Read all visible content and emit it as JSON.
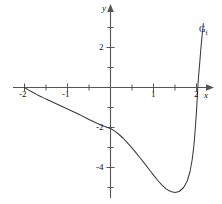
{
  "figure": {
    "background_color": "#ffffff",
    "line_color": "#3b3b3b",
    "text_color": "#111111"
  },
  "axes": {
    "x_axis_name": "x",
    "y_axis_name": "y"
  },
  "labels": {
    "curve_name_base": "G",
    "curve_name_sub": "f"
  },
  "chart_data": {
    "type": "line",
    "title": "",
    "xlabel": "x",
    "ylabel": "y",
    "grid": false,
    "legend": "none",
    "xlim": [
      -2.55,
      2.45
    ],
    "ylim": [
      -5.9,
      3.4
    ],
    "xticks_major": [
      -2,
      -1,
      1,
      2
    ],
    "xticks_major_labels": [
      "-2",
      "-1",
      "1",
      "2"
    ],
    "xticks_minor": [
      -1.5,
      -0.5,
      0.5,
      1.5
    ],
    "yticks_major": [
      2,
      -2,
      -4
    ],
    "yticks_major_labels": [
      "2",
      "-2",
      "-4"
    ],
    "yticks_minor": [
      3,
      1,
      -1,
      -3,
      -5
    ],
    "annotations": [
      {
        "text": "G_f",
        "x": 2.15,
        "y": 2.55
      }
    ],
    "series": [
      {
        "name": "G_f",
        "points": [
          [
            -2.0,
            0.0
          ],
          [
            -1.9,
            -0.13
          ],
          [
            -1.8,
            -0.25
          ],
          [
            -1.7,
            -0.37
          ],
          [
            -1.6,
            -0.47
          ],
          [
            -1.5,
            -0.58
          ],
          [
            -1.4,
            -0.68
          ],
          [
            -1.3,
            -0.78
          ],
          [
            -1.2,
            -0.88
          ],
          [
            -1.1,
            -0.98
          ],
          [
            -1.0,
            -1.08
          ],
          [
            -0.9,
            -1.18
          ],
          [
            -0.8,
            -1.28
          ],
          [
            -0.7,
            -1.38
          ],
          [
            -0.6,
            -1.49
          ],
          [
            -0.5,
            -1.6
          ],
          [
            -0.4,
            -1.7
          ],
          [
            -0.3,
            -1.8
          ],
          [
            -0.2,
            -1.9
          ],
          [
            -0.1,
            -1.97
          ],
          [
            0.0,
            -2.05
          ],
          [
            0.1,
            -2.18
          ],
          [
            0.2,
            -2.35
          ],
          [
            0.3,
            -2.55
          ],
          [
            0.4,
            -2.78
          ],
          [
            0.5,
            -3.02
          ],
          [
            0.6,
            -3.28
          ],
          [
            0.7,
            -3.55
          ],
          [
            0.8,
            -3.82
          ],
          [
            0.9,
            -4.1
          ],
          [
            1.0,
            -4.38
          ],
          [
            1.1,
            -4.65
          ],
          [
            1.2,
            -4.88
          ],
          [
            1.3,
            -5.08
          ],
          [
            1.4,
            -5.2
          ],
          [
            1.5,
            -5.25
          ],
          [
            1.6,
            -5.2
          ],
          [
            1.7,
            -5.0
          ],
          [
            1.78,
            -4.7
          ],
          [
            1.85,
            -4.2
          ],
          [
            1.9,
            -3.6
          ],
          [
            1.94,
            -2.9
          ],
          [
            1.97,
            -2.1
          ],
          [
            2.0,
            -1.2
          ],
          [
            2.02,
            -0.4
          ],
          [
            2.04,
            0.35
          ],
          [
            2.07,
            1.1
          ],
          [
            2.1,
            1.9
          ],
          [
            2.13,
            2.6
          ],
          [
            2.16,
            3.2
          ]
        ]
      }
    ]
  }
}
